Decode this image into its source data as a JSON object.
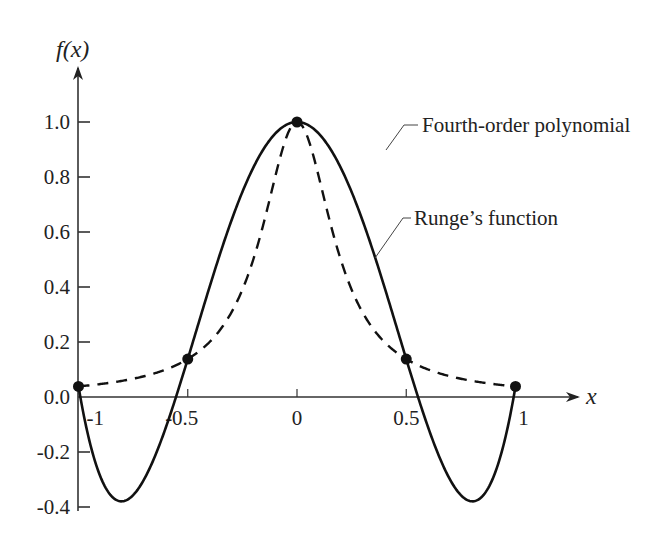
{
  "chart_data": {
    "type": "line",
    "title": "",
    "xlabel": "x",
    "ylabel": "f(x)",
    "xlim": [
      -1,
      1
    ],
    "ylim": [
      -0.4,
      1.0
    ],
    "grid": false,
    "x_ticks": [
      {
        "value": -1,
        "label": "-1"
      },
      {
        "value": -0.5,
        "label": "-0.5"
      },
      {
        "value": 0,
        "label": "0"
      },
      {
        "value": 0.5,
        "label": "0.5"
      },
      {
        "value": 1,
        "label": "1"
      }
    ],
    "y_ticks": [
      {
        "value": 1.0,
        "label": "1.0"
      },
      {
        "value": 0.8,
        "label": "0.8"
      },
      {
        "value": 0.6,
        "label": "0.6"
      },
      {
        "value": 0.4,
        "label": "0.4"
      },
      {
        "value": 0.2,
        "label": "0.2"
      },
      {
        "value": 0.0,
        "label": "0.0"
      },
      {
        "value": -0.2,
        "label": "-0.2"
      },
      {
        "value": -0.4,
        "label": "-0.4"
      }
    ],
    "series": [
      {
        "name": "Fourth-order polynomial",
        "style": "solid",
        "function": "4th-order polynomial interpolating Runge's function at x = -1, -0.5, 0, 0.5, 1",
        "sample_points": {
          "x": [
            -1,
            -0.9,
            -0.8,
            -0.7,
            -0.6,
            -0.5,
            -0.4,
            -0.3,
            -0.2,
            -0.1,
            0,
            0.1,
            0.2,
            0.3,
            0.4,
            0.5,
            0.6,
            0.7,
            0.8,
            0.9,
            1
          ],
          "y": [
            0.0385,
            -0.2542,
            -0.375,
            -0.3524,
            -0.2256,
            -0.0367,
            0.1782,
            0.4012,
            0.6152,
            0.8043,
            1.0,
            0.8043,
            0.6152,
            0.4012,
            0.1782,
            0.1379,
            -0.2256,
            -0.3524,
            -0.375,
            -0.2542,
            0.0385
          ]
        }
      },
      {
        "name": "Runge's function",
        "style": "dashed",
        "function": "f(x) = 1 / (1 + 25x^2)",
        "sample_points": {
          "x": [
            -1,
            -0.8,
            -0.6,
            -0.5,
            -0.4,
            -0.3,
            -0.2,
            -0.1,
            0,
            0.1,
            0.2,
            0.3,
            0.4,
            0.5,
            0.6,
            0.8,
            1
          ],
          "y": [
            0.0385,
            0.0588,
            0.1,
            0.1379,
            0.2,
            0.3077,
            0.5,
            0.8,
            1.0,
            0.8,
            0.5,
            0.3077,
            0.2,
            0.1379,
            0.1,
            0.0588,
            0.0385
          ]
        }
      }
    ],
    "markers": {
      "name": "Interpolation points",
      "x": [
        -1,
        -0.5,
        0,
        0.5,
        1
      ],
      "y": [
        0.0385,
        0.1379,
        1.0,
        0.1379,
        0.0385
      ]
    },
    "annotations": [
      {
        "text": "Fourth-order polynomial",
        "points_to": "solid curve",
        "at_x": 0.4
      },
      {
        "text": "Runge’s function",
        "points_to": "dashed curve",
        "at_x": 0.27
      }
    ],
    "legend": "none (callout annotations at top-right)"
  }
}
